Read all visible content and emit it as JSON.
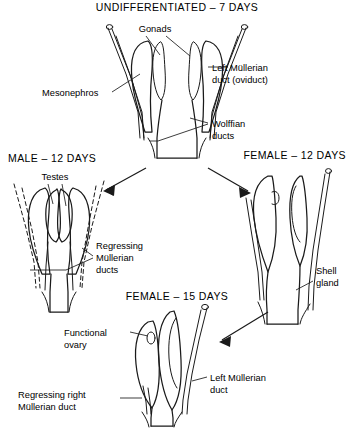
{
  "figure": {
    "stages": [
      {
        "id": "undifferentiated",
        "title": "UNDIFFERENTIATED – 7 DAYS",
        "labels": [
          {
            "id": "gonads",
            "text": "Gonads"
          },
          {
            "id": "mesonephros",
            "text": "Mesonephros"
          },
          {
            "id": "left-mullerian-duct",
            "line1": "Left Müllerian",
            "line2": "duct (oviduct)"
          },
          {
            "id": "wolffian-ducts",
            "line1": "Wolffian",
            "line2": "ducts"
          }
        ]
      },
      {
        "id": "male-12-days",
        "title": "MALE – 12 DAYS",
        "labels": [
          {
            "id": "testes",
            "text": "Testes"
          },
          {
            "id": "regressing-mullerian-ducts",
            "line1": "Regressing",
            "line2": "Müllerian",
            "line3": "ducts"
          }
        ]
      },
      {
        "id": "female-12-days",
        "title": "FEMALE – 12 DAYS",
        "labels": [
          {
            "id": "shell-gland",
            "line1": "Shell",
            "line2": "gland"
          }
        ]
      },
      {
        "id": "female-15-days",
        "title": "FEMALE – 15 DAYS",
        "labels": [
          {
            "id": "functional-ovary",
            "line1": "Functional",
            "line2": "ovary"
          },
          {
            "id": "left-mullerian-duct",
            "line1": "Left Müllerian",
            "line2": "duct"
          },
          {
            "id": "regressing-right-mullerian-duct",
            "line1": "Regressing right",
            "line2": "Müllerian duct"
          }
        ]
      }
    ],
    "colors": {
      "ink": "#1a1a1a",
      "background": "#ffffff"
    }
  }
}
